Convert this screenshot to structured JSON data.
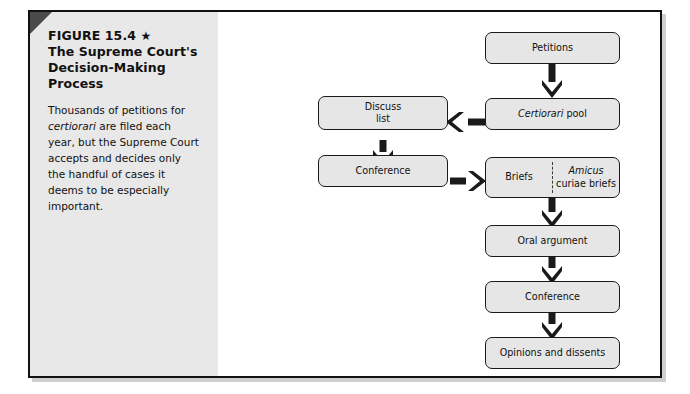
{
  "figure": {
    "number_label": "FIGURE 15.4",
    "star_glyph": "★",
    "title_line1": "The Supreme Court's",
    "title_line2": "Decision-Making",
    "title_line3": "Process",
    "caption_part1": "Thousands of petitions for ",
    "caption_italic": "certiorari",
    "caption_part2": " are filed each year, but the Supreme Court accepts and decides only the handful of cases it deems to be especially important."
  },
  "colors": {
    "box_fill": "#e6e6e6",
    "box_stroke": "#1a1a1a",
    "sidebar_bg": "#e8e8e8",
    "arrow": "#1a1a1a",
    "corner_fold": "#4a4a4a",
    "frame_border": "#111111"
  },
  "flowchart": {
    "type": "diagram",
    "nodes": [
      {
        "id": "petitions",
        "label": "Petitions"
      },
      {
        "id": "cert-pool",
        "label_italic": "Certiorari",
        "label_rest": " pool"
      },
      {
        "id": "discuss-list",
        "label_line1": "Discuss",
        "label_line2": "list"
      },
      {
        "id": "conference-1",
        "label": "Conference"
      },
      {
        "id": "briefs",
        "label": "Briefs"
      },
      {
        "id": "amicus",
        "label_italic": "Amicus",
        "label_rest": "curiae briefs"
      },
      {
        "id": "oral-argument",
        "label": "Oral argument"
      },
      {
        "id": "conference-2",
        "label": "Conference"
      },
      {
        "id": "opinions",
        "label": "Opinions and dissents"
      }
    ],
    "edges": [
      {
        "from": "petitions",
        "to": "cert-pool",
        "direction": "down"
      },
      {
        "from": "cert-pool",
        "to": "discuss-list",
        "direction": "left"
      },
      {
        "from": "discuss-list",
        "to": "conference-1",
        "direction": "down"
      },
      {
        "from": "conference-1",
        "to": "briefs",
        "direction": "right"
      },
      {
        "from": "briefs",
        "to": "oral-argument",
        "direction": "down"
      },
      {
        "from": "oral-argument",
        "to": "conference-2",
        "direction": "down"
      },
      {
        "from": "conference-2",
        "to": "opinions",
        "direction": "down"
      }
    ]
  }
}
